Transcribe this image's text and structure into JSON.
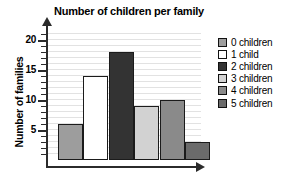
{
  "chart_data": {
    "type": "bar",
    "title": "Number of children per family",
    "xlabel": "",
    "ylabel": "Number of families",
    "categories": [
      "0 children",
      "1 child",
      "2 children",
      "3 children",
      "4 children",
      "5 children"
    ],
    "values": [
      6,
      14,
      18,
      9,
      10,
      3
    ],
    "ylim": [
      0,
      21
    ],
    "y_ticks_major": [
      5,
      10,
      15,
      20
    ],
    "y_tick_labels": [
      "5",
      "10",
      "15",
      "20"
    ],
    "y_minor_tick_step": 1,
    "grid": true,
    "grid_orientation": "horizontal",
    "legend_position": "right",
    "bar_colors": [
      "#9d9d9d",
      "#ffffff",
      "#333333",
      "#d2d2d2",
      "#8a8a8a",
      "#6b6b6b"
    ],
    "bar_border_color": "#1b1b1b",
    "axis_color": "#2b2b2b",
    "grid_color": "#e2e2e2",
    "legend": [
      {
        "label": "0 children",
        "color": "#9d9d9d"
      },
      {
        "label": "1 child",
        "color": "#ffffff"
      },
      {
        "label": "2 children",
        "color": "#333333"
      },
      {
        "label": "3 children",
        "color": "#d2d2d2"
      },
      {
        "label": "4 children",
        "color": "#8a8a8a"
      },
      {
        "label": "5 children",
        "color": "#6b6b6b"
      }
    ]
  }
}
